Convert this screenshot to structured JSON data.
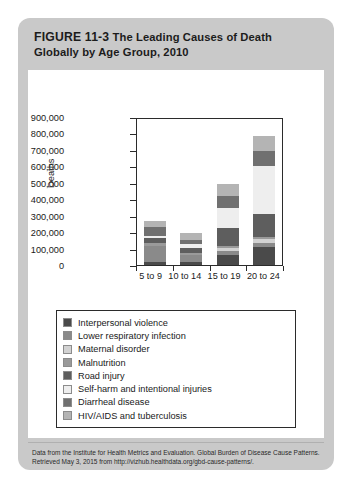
{
  "figure": {
    "number_label": "FIGURE 11-3",
    "title": "The Leading Causes of Death Globally by Age Group, 2010",
    "title_line1": "The Leading Causes of Death",
    "title_line2": "Globally by Age Group, 2010",
    "source_note": "Data from the Institute for Health Metrics and Evaluation. Global Burden of Disease Cause Patterns. Retrieved May 3, 2015 from http://vizhub.healthdata.org/gbd-cause-patterns/."
  },
  "colors": {
    "card_background": "#c9c9c9",
    "panel_background": "#ffffff",
    "axis": "#2b2b2b",
    "text": "#1a1a1a"
  },
  "chart_data": {
    "type": "bar",
    "stacked": true,
    "title": "",
    "xlabel": "",
    "ylabel": "Deaths",
    "ylim": [
      0,
      900000
    ],
    "ytick_values": [
      0,
      100000,
      200000,
      300000,
      400000,
      500000,
      600000,
      700000,
      800000,
      900000
    ],
    "ytick_labels": [
      "0",
      "100,000",
      "200,000",
      "300,000",
      "400,000",
      "500,000",
      "600,000",
      "700,000",
      "800,000",
      "900,000"
    ],
    "grid": false,
    "legend_position": "below",
    "categories": [
      "5 to 9",
      "10 to 14",
      "15 to 19",
      "20 to 24"
    ],
    "series": [
      {
        "name": "Interpersonal violence",
        "color": "#4a4a4a",
        "values": [
          18000,
          17000,
          63000,
          110000
        ]
      },
      {
        "name": "Lower respiratory infection",
        "color": "#8a8a8a",
        "values": [
          96000,
          44000,
          22000,
          21000
        ]
      },
      {
        "name": "Maternal disorder",
        "color": "#d2d2d2",
        "values": [
          0,
          0,
          18000,
          30000
        ]
      },
      {
        "name": "Malnutrition",
        "color": "#9a9a9a",
        "values": [
          20000,
          12000,
          12000,
          12000
        ]
      },
      {
        "name": "Road injury",
        "color": "#5e5e5e",
        "values": [
          33000,
          28000,
          108000,
          140000
        ]
      },
      {
        "name": "Self-harm and intentional injuries",
        "color": "#eeeeee",
        "values": [
          12000,
          26000,
          125000,
          290000
        ]
      },
      {
        "name": "Diarrheal disease",
        "color": "#707070",
        "values": [
          55000,
          27000,
          70000,
          88000
        ]
      },
      {
        "name": "HIV/AIDS and tuberculosis",
        "color": "#b4b4b4",
        "values": [
          31000,
          41000,
          72000,
          92000
        ]
      }
    ],
    "totals": [
      265000,
      195000,
      490000,
      783000
    ]
  },
  "legend": {
    "items": [
      {
        "label": "Interpersonal violence",
        "color": "#4a4a4a"
      },
      {
        "label": "Lower respiratory infection",
        "color": "#8a8a8a"
      },
      {
        "label": "Maternal disorder",
        "color": "#d2d2d2"
      },
      {
        "label": "Malnutrition",
        "color": "#9a9a9a"
      },
      {
        "label": "Road injury",
        "color": "#5e5e5e"
      },
      {
        "label": "Self-harm and intentional injuries",
        "color": "#eeeeee"
      },
      {
        "label": "Diarrheal disease",
        "color": "#707070"
      },
      {
        "label": "HIV/AIDS and tuberculosis",
        "color": "#b4b4b4"
      }
    ]
  }
}
